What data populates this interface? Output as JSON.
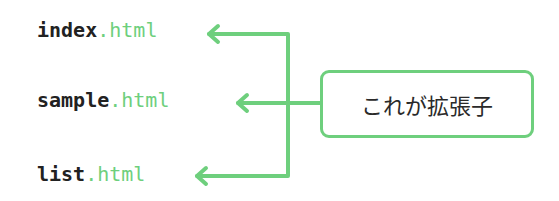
{
  "files": [
    {
      "base": "index",
      "ext": ".html"
    },
    {
      "base": "sample",
      "ext": ".html"
    },
    {
      "base": "list",
      "ext": ".html"
    }
  ],
  "callout": {
    "label": "これが拡張子"
  },
  "colors": {
    "accent": "#6ecf7d",
    "text": "#222222"
  }
}
